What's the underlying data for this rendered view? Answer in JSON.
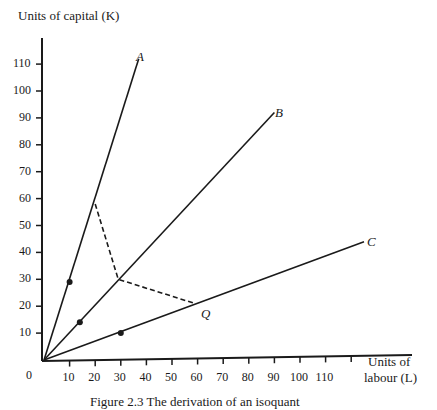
{
  "chart_data": {
    "type": "line",
    "title": "",
    "caption": "Figure 2.3 The derivation of an isoquant",
    "xlabel": "Units of labour (L)",
    "xlabel_lines": [
      "Units of",
      "labour (L)"
    ],
    "ylabel": "Units of capital (K)",
    "x_origin_label": "0",
    "x_ticks": [
      10,
      20,
      30,
      40,
      50,
      60,
      70,
      80,
      90,
      100,
      110
    ],
    "y_ticks": [
      10,
      20,
      30,
      40,
      50,
      60,
      70,
      80,
      90,
      100,
      110
    ],
    "xlim": [
      0,
      120
    ],
    "ylim": [
      0,
      120
    ],
    "grid": false,
    "series": [
      {
        "name": "A",
        "style": "solid",
        "points": [
          [
            0,
            0
          ],
          [
            37,
            112
          ]
        ]
      },
      {
        "name": "B",
        "style": "solid",
        "points": [
          [
            0,
            0
          ],
          [
            90,
            92
          ]
        ]
      },
      {
        "name": "C",
        "style": "solid",
        "points": [
          [
            0,
            0
          ],
          [
            125,
            44
          ]
        ]
      },
      {
        "name": "isoquant Q",
        "style": "dashed",
        "points": [
          [
            20,
            58
          ],
          [
            29,
            30
          ],
          [
            59,
            21
          ]
        ]
      }
    ],
    "markers": [
      {
        "on": "A",
        "x": 10,
        "y": 29
      },
      {
        "on": "B",
        "x": 14,
        "y": 14
      },
      {
        "on": "C",
        "x": 30,
        "y": 10
      }
    ],
    "annotations": [
      {
        "text": "A",
        "at": "end of ray A"
      },
      {
        "text": "B",
        "at": "end of ray B"
      },
      {
        "text": "C",
        "at": "end of ray C"
      },
      {
        "text": "Q",
        "at": "end of dashed isoquant on ray C"
      }
    ]
  },
  "labels": {
    "y_axis_title": "Units of capital (K)",
    "x_axis_title_1": "Units of",
    "x_axis_title_2": "labour (L)",
    "origin": "0",
    "ray_a": "A",
    "ray_b": "B",
    "ray_c": "C",
    "isoquant": "Q",
    "caption": "Figure 2.3 The derivation of an isoquant"
  }
}
